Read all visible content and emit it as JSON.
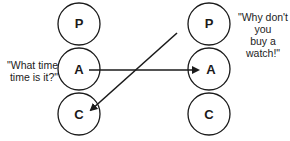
{
  "diagram": {
    "type": "transactional-analysis",
    "left_person": {
      "states": [
        "P",
        "A",
        "C"
      ],
      "quote": "\"What time\ntime is it?\""
    },
    "right_person": {
      "states": [
        "P",
        "A",
        "C"
      ],
      "quote": "\"Why don't you\nbuy a watch!\""
    },
    "arrows": [
      {
        "from": "left.A",
        "to": "right.A"
      },
      {
        "from": "right.P",
        "to": "left.C"
      }
    ]
  },
  "left": {
    "p": "P",
    "a": "A",
    "c": "C",
    "quote_line1": "\"What time",
    "quote_line2": "time is it?\""
  },
  "right": {
    "p": "P",
    "a": "A",
    "c": "C",
    "quote_line1": "\"Why don't you",
    "quote_line2": "buy a watch!\""
  },
  "colors": {
    "stroke": "#1a1a1a",
    "background": "#ffffff"
  }
}
